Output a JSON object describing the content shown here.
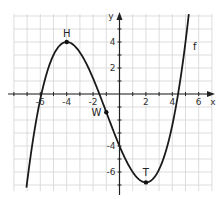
{
  "chart_data": {
    "type": "line",
    "title": "",
    "xlabel": "x",
    "ylabel": "y",
    "function_label": "f",
    "function": "f(x) = 0.1x^3 + 0.3x^2 - 2.4x - 4 (approx.)",
    "xlim": [
      -8,
      7
    ],
    "ylim": [
      -7.5,
      6
    ],
    "grid": true,
    "x_ticks": [
      -6,
      -4,
      -2,
      2,
      4,
      6
    ],
    "y_ticks": [
      4,
      2,
      -4,
      -6
    ],
    "x_tick_labels": [
      "-6",
      "-4",
      "-2",
      "2",
      "4",
      "6"
    ],
    "y_tick_labels": [
      "4",
      "2",
      "-4",
      "-6"
    ],
    "points": [
      {
        "name": "H",
        "x": -4,
        "y": 4,
        "role": "maximum"
      },
      {
        "name": "W",
        "x": -1,
        "y": -1.4,
        "role": "inflection point"
      },
      {
        "name": "T",
        "x": 2,
        "y": -6.8,
        "role": "minimum"
      }
    ],
    "series": [
      {
        "name": "f",
        "x": [
          -7,
          -6,
          -5,
          -4,
          -3,
          -2,
          -1,
          0,
          1,
          2,
          3,
          4,
          5,
          5.5
        ],
        "y": [
          -6.6,
          -0.4,
          2.5,
          4.0,
          4.0,
          2.8,
          -1.4,
          -4.0,
          -6.0,
          -6.8,
          -5.6,
          -1.6,
          6.0,
          11.4
        ]
      }
    ],
    "colors": {
      "curve": "#1a1a1a",
      "grid": "#d4d4d4",
      "axis": "#222222"
    }
  }
}
